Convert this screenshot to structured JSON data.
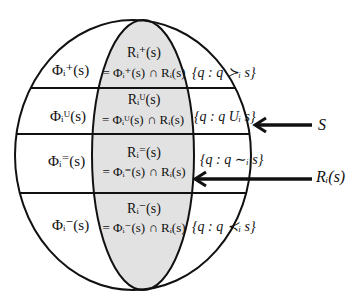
{
  "diagram": {
    "title": "",
    "colors": {
      "background": "#ffffff",
      "stroke": "#111111",
      "shaded_region": "#e2e2e2"
    },
    "outer_set": {
      "label": "S",
      "description": "Outer circle representing set S"
    },
    "inner_set": {
      "label": "R_i(s)",
      "display": "Rᵢ(s)"
    },
    "rows": [
      {
        "id": "plus",
        "phi_label": "Φᵢ⁺(s)",
        "r_label": "Rᵢ⁺(s)",
        "r_def": "= Φᵢ⁺(s) ∩ Rᵢ(s)",
        "set_def": "{q : q ≻ᵢ s}"
      },
      {
        "id": "U",
        "phi_label": "Φᵢᵁ(s)",
        "r_label": "Rᵢᵁ(s)",
        "r_def": "= Φᵢᵁ(s) ∩ Rᵢ(s)",
        "set_def": "{q : q Uᵢ s}"
      },
      {
        "id": "equal",
        "phi_label": "Φᵢ⁼(s)",
        "r_label": "Rᵢ⁼(s)",
        "r_def": "= Φᵢ⁼(s) ∩ Rᵢ(s)",
        "set_def": "{q : q ∼ᵢ s}"
      },
      {
        "id": "minus",
        "phi_label": "Φᵢ⁻(s)",
        "r_label": "Rᵢ⁻(s)",
        "r_def": "= Φᵢ⁻(s) ∩ Rᵢ(s)",
        "set_def": "{q : q ≺ᵢ s}"
      }
    ],
    "arrows": [
      {
        "label": "S",
        "points_to": "outer circle"
      },
      {
        "label": "Rᵢ(s)",
        "points_to": "inner shaded ellipse"
      }
    ]
  }
}
